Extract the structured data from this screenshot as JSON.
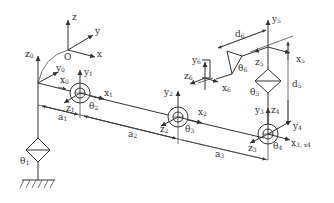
{
  "diagram": {
    "base_frame": {
      "z": "z",
      "y": "y",
      "x": "x",
      "origin": "O"
    },
    "frame0": {
      "z": "z",
      "z_sub": "0",
      "y": "y",
      "y_sub": "0",
      "x": "x",
      "x_sub": "0"
    },
    "frame1": {
      "y": "y",
      "y_sub": "1",
      "x": "x",
      "x_sub": "1",
      "z": "z",
      "z_sub": "1"
    },
    "frame2": {
      "y": "y",
      "y_sub": "2",
      "x": "x",
      "x_sub": "2",
      "z": "z",
      "z_sub": "2"
    },
    "frame3": {
      "y": "y",
      "y_sub": "3",
      "z": "z",
      "z_sub": "3",
      "x": "x",
      "x_sub": "3, x",
      "x_sub2": "4"
    },
    "frame4": {
      "z": "z",
      "z_sub": "4",
      "y": "y",
      "y_sub": "4"
    },
    "frame5": {
      "y": "y",
      "y_sub": "5",
      "z": "z",
      "z_sub": "5",
      "x": "x",
      "x_sub": "5"
    },
    "frame6": {
      "y": "y",
      "y_sub": "6",
      "z": "z",
      "z_sub": "6",
      "x": "x",
      "x_sub": "6"
    },
    "joints": [
      {
        "name": "θ",
        "sub": "1"
      },
      {
        "name": "θ",
        "sub": "2"
      },
      {
        "name": "θ",
        "sub": "3"
      },
      {
        "name": "θ",
        "sub": "4"
      },
      {
        "name": "θ",
        "sub": "5"
      },
      {
        "name": "θ",
        "sub": "6"
      }
    ],
    "dimensions": [
      {
        "name": "a",
        "sub": "1"
      },
      {
        "name": "a",
        "sub": "2"
      },
      {
        "name": "a",
        "sub": "3"
      },
      {
        "name": "d",
        "sub": "5"
      },
      {
        "name": "d",
        "sub": "6"
      }
    ]
  }
}
